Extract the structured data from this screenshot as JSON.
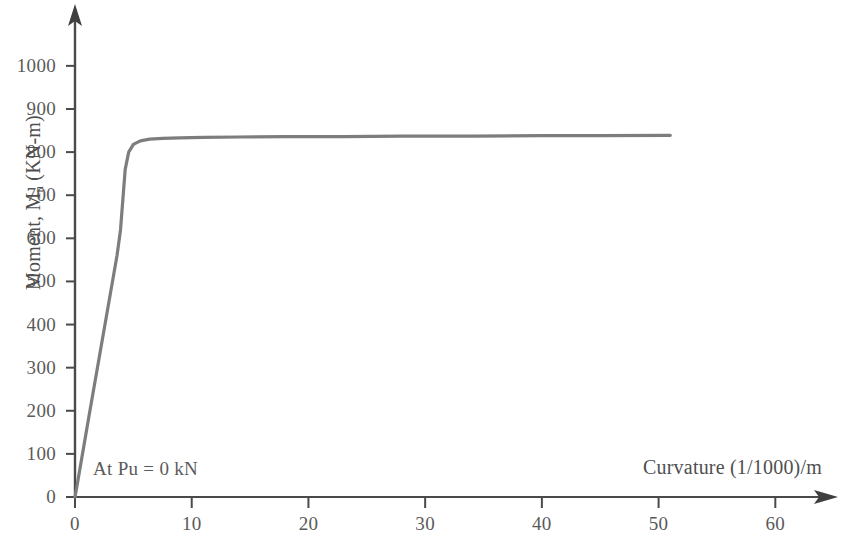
{
  "chart_data": {
    "type": "line",
    "title": "",
    "subtitle": "",
    "xlabel": "Curvature (1/1000)/m",
    "ylabel_text": "Moment, M",
    "ylabel_sub": "n",
    "ylabel_tail": " (KN-m)",
    "ylabel_full": "Moment, Mn (KN-m)",
    "annotation": "At Pu = 0 kN",
    "grid": false,
    "legend": "none",
    "xlim": [
      0,
      64
    ],
    "ylim": [
      0,
      1060
    ],
    "xticks": [
      0,
      10,
      20,
      30,
      40,
      50,
      60
    ],
    "xtick_labels": [
      "0",
      "10",
      "20",
      "30",
      "40",
      "50",
      "60"
    ],
    "yticks": [
      0,
      100,
      200,
      300,
      400,
      500,
      600,
      700,
      800,
      900,
      1000
    ],
    "ytick_labels": [
      "0",
      "100",
      "200",
      "300",
      "400",
      "500",
      "600",
      "700",
      "800",
      "900",
      "1000"
    ],
    "series": [
      {
        "name": "Moment-Curvature (Pu = 0 kN)",
        "color": "#7d7d7d",
        "line_width": 3.2,
        "x": [
          0.0,
          0.15,
          0.4,
          0.8,
          1.2,
          1.6,
          2.0,
          2.4,
          2.8,
          3.2,
          3.6,
          3.9,
          4.1,
          4.3,
          4.6,
          5.0,
          5.6,
          6.4,
          7.5,
          9.0,
          11.0,
          14.0,
          18.0,
          23.0,
          28.0,
          34.0,
          40.0,
          45.0,
          51.0
        ],
        "y": [
          0,
          22,
          62,
          125,
          188,
          250,
          312,
          374,
          436,
          498,
          560,
          620,
          690,
          760,
          800,
          818,
          826,
          830,
          832,
          833,
          834,
          835,
          836,
          836,
          837,
          837,
          838,
          838,
          839
        ]
      }
    ]
  },
  "axes": {
    "x_arrow": "arrow-right",
    "y_arrow": "arrow-up",
    "axis_color": "#4a4a4a"
  }
}
